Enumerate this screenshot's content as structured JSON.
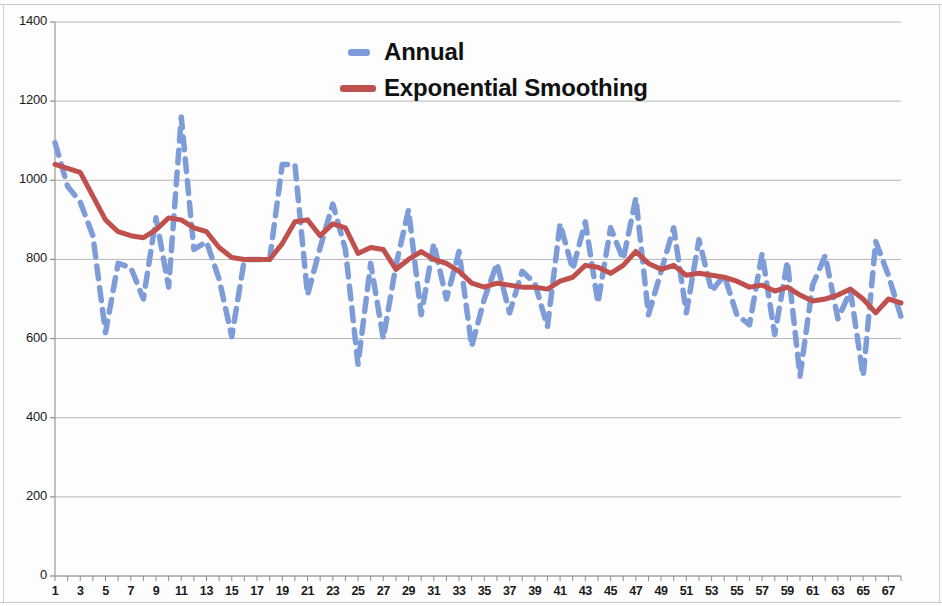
{
  "chart_data": {
    "type": "line",
    "title": "",
    "xlabel": "",
    "ylabel": "",
    "xlim": [
      1,
      68
    ],
    "ylim": [
      0,
      1400
    ],
    "grid": true,
    "legend_position": "top-center",
    "y_ticks": [
      0,
      200,
      400,
      600,
      800,
      1000,
      1200,
      1400
    ],
    "x_ticks": [
      1,
      3,
      5,
      7,
      9,
      11,
      13,
      15,
      17,
      19,
      21,
      23,
      25,
      27,
      29,
      31,
      33,
      35,
      37,
      39,
      41,
      43,
      45,
      47,
      49,
      51,
      53,
      55,
      57,
      59,
      61,
      63,
      65,
      67
    ],
    "x": [
      1,
      2,
      3,
      4,
      5,
      6,
      7,
      8,
      9,
      10,
      11,
      12,
      13,
      14,
      15,
      16,
      17,
      18,
      19,
      20,
      21,
      22,
      23,
      24,
      25,
      26,
      27,
      28,
      29,
      30,
      31,
      32,
      33,
      34,
      35,
      36,
      37,
      38,
      39,
      40,
      41,
      42,
      43,
      44,
      45,
      46,
      47,
      48,
      49,
      50,
      51,
      52,
      53,
      54,
      55,
      56,
      57,
      58,
      59,
      60,
      61,
      62,
      63,
      64,
      65,
      66,
      67,
      68
    ],
    "series": [
      {
        "name": "Annual",
        "style": "dashed",
        "color": "#7e9cd8",
        "values": [
          1095,
          985,
          945,
          860,
          615,
          790,
          780,
          700,
          905,
          730,
          1160,
          825,
          845,
          750,
          605,
          800,
          800,
          800,
          1040,
          1040,
          710,
          830,
          940,
          825,
          535,
          790,
          600,
          785,
          925,
          660,
          840,
          700,
          820,
          580,
          700,
          790,
          665,
          770,
          740,
          630,
          890,
          775,
          895,
          690,
          880,
          800,
          955,
          660,
          770,
          880,
          665,
          850,
          720,
          760,
          660,
          635,
          815,
          610,
          795,
          505,
          735,
          810,
          650,
          720,
          505,
          845,
          760,
          655
        ]
      },
      {
        "name": "Exponential Smoothing",
        "style": "solid",
        "color": "#c0504d",
        "values": [
          1040,
          1030,
          1020,
          960,
          900,
          870,
          860,
          855,
          875,
          905,
          900,
          880,
          870,
          830,
          805,
          800,
          800,
          800,
          840,
          895,
          900,
          860,
          890,
          880,
          815,
          830,
          825,
          775,
          800,
          820,
          800,
          790,
          770,
          740,
          730,
          740,
          735,
          730,
          730,
          725,
          745,
          755,
          785,
          780,
          765,
          785,
          820,
          790,
          775,
          785,
          760,
          765,
          760,
          755,
          745,
          730,
          735,
          720,
          730,
          710,
          695,
          700,
          710,
          725,
          700,
          665,
          700,
          690
        ]
      }
    ]
  }
}
